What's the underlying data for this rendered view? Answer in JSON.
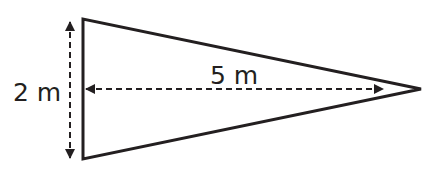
{
  "diagram": {
    "shape": "isosceles-triangle",
    "labels": {
      "height": "2 m",
      "length": "5 m"
    },
    "colors": {
      "stroke": "#231f20",
      "background": "#ffffff"
    }
  }
}
